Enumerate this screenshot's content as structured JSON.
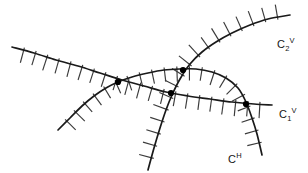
{
  "figure": {
    "width": 308,
    "height": 173,
    "background": "#ffffff",
    "stroke_color": "#1a1a1a",
    "hatch_color": "#3a3a3a",
    "node_color": "#000000"
  },
  "labels": {
    "c2v": {
      "base": "C",
      "sub": "2",
      "sup": "V",
      "x": 277,
      "y": 37
    },
    "c1v": {
      "base": "C",
      "sub": "1",
      "sup": "V",
      "x": 279,
      "y": 107
    },
    "ch": {
      "base": "C",
      "sub": "",
      "sup": "H",
      "x": 228,
      "y": 152
    }
  },
  "chart_data": {
    "type": "line",
    "title": "",
    "xlabel": "",
    "ylabel": "",
    "xlim": [
      0,
      308
    ],
    "ylim": [
      0,
      173
    ],
    "grid": false,
    "legend_position": "inline-right",
    "curves": [
      {
        "name": "C1V",
        "label": "C1 V",
        "style": "hatched-constraint-curve",
        "hatch_side": "below",
        "hatch_count": 22,
        "hatch_length": 13,
        "points": [
          [
            12,
            47
          ],
          [
            34,
            53
          ],
          [
            56,
            60
          ],
          [
            78,
            66
          ],
          [
            100,
            73
          ],
          [
            122,
            80
          ],
          [
            144,
            86
          ],
          [
            166,
            92
          ],
          [
            188,
            96
          ],
          [
            210,
            99
          ],
          [
            232,
            102
          ],
          [
            254,
            104
          ],
          [
            272,
            105
          ]
        ]
      },
      {
        "name": "C2V",
        "label": "C2 V",
        "style": "hatched-constraint-curve",
        "hatch_side": "left",
        "hatch_count": 18,
        "hatch_length": 13,
        "points": [
          [
            148,
            170
          ],
          [
            154,
            148
          ],
          [
            160,
            128
          ],
          [
            166,
            110
          ],
          [
            172,
            95
          ],
          [
            180,
            79
          ],
          [
            190,
            64
          ],
          [
            202,
            52
          ],
          [
            216,
            42
          ],
          [
            232,
            33
          ],
          [
            250,
            25
          ],
          [
            268,
            19
          ],
          [
            290,
            15
          ]
        ]
      },
      {
        "name": "CH",
        "label": "C H",
        "style": "hatched-constraint-arc",
        "hatch_side": "below-outside",
        "hatch_count": 22,
        "hatch_length": 12,
        "points": [
          [
            58,
            130
          ],
          [
            70,
            118
          ],
          [
            82,
            106
          ],
          [
            94,
            96
          ],
          [
            106,
            88
          ],
          [
            118,
            82
          ],
          [
            132,
            77
          ],
          [
            148,
            73
          ],
          [
            164,
            70
          ],
          [
            180,
            69
          ],
          [
            196,
            69
          ],
          [
            212,
            72
          ],
          [
            226,
            78
          ],
          [
            238,
            88
          ],
          [
            246,
            102
          ],
          [
            252,
            118
          ],
          [
            257,
            134
          ],
          [
            262,
            155
          ]
        ]
      }
    ],
    "nodes": [
      {
        "name": "node-c1v-ch-left",
        "x": 118,
        "y": 82,
        "radius": 3.1
      },
      {
        "name": "node-c2v-ch-top",
        "x": 183,
        "y": 70,
        "radius": 3.1
      },
      {
        "name": "node-c1v-c2v",
        "x": 171,
        "y": 93,
        "radius": 3.1
      },
      {
        "name": "node-c1v-ch-right",
        "x": 246,
        "y": 104,
        "radius": 3.1
      }
    ]
  }
}
